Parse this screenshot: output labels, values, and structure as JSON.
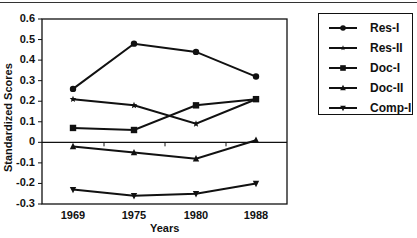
{
  "chart_data": {
    "type": "line",
    "title": "",
    "xlabel": "Years",
    "ylabel": "Standardized Scores",
    "categories": [
      "1969",
      "1975",
      "1980",
      "1988"
    ],
    "ylim": [
      -0.3,
      0.6
    ],
    "yticks": [
      "0.6",
      "0.5",
      "0.4",
      "0.3",
      "0.2",
      "0.1",
      "0",
      "-0.1",
      "-0.2",
      "-0.3"
    ],
    "grid": false,
    "zero_line": true,
    "legend_position": "right",
    "series": [
      {
        "name": "Res-I",
        "marker": "circle",
        "values": [
          0.26,
          0.48,
          0.44,
          0.32
        ]
      },
      {
        "name": "Res-II",
        "marker": "star",
        "values": [
          0.21,
          0.18,
          0.09,
          0.21
        ]
      },
      {
        "name": "Doc-I",
        "marker": "square",
        "values": [
          0.07,
          0.06,
          0.18,
          0.21
        ]
      },
      {
        "name": "Doc-II",
        "marker": "triangle-up",
        "values": [
          -0.02,
          -0.05,
          -0.08,
          0.01
        ]
      },
      {
        "name": "Comp-I",
        "marker": "triangle-down",
        "values": [
          -0.23,
          -0.26,
          -0.25,
          -0.2
        ]
      }
    ]
  },
  "colors": {
    "line": "#111111",
    "background": "#ffffff"
  }
}
